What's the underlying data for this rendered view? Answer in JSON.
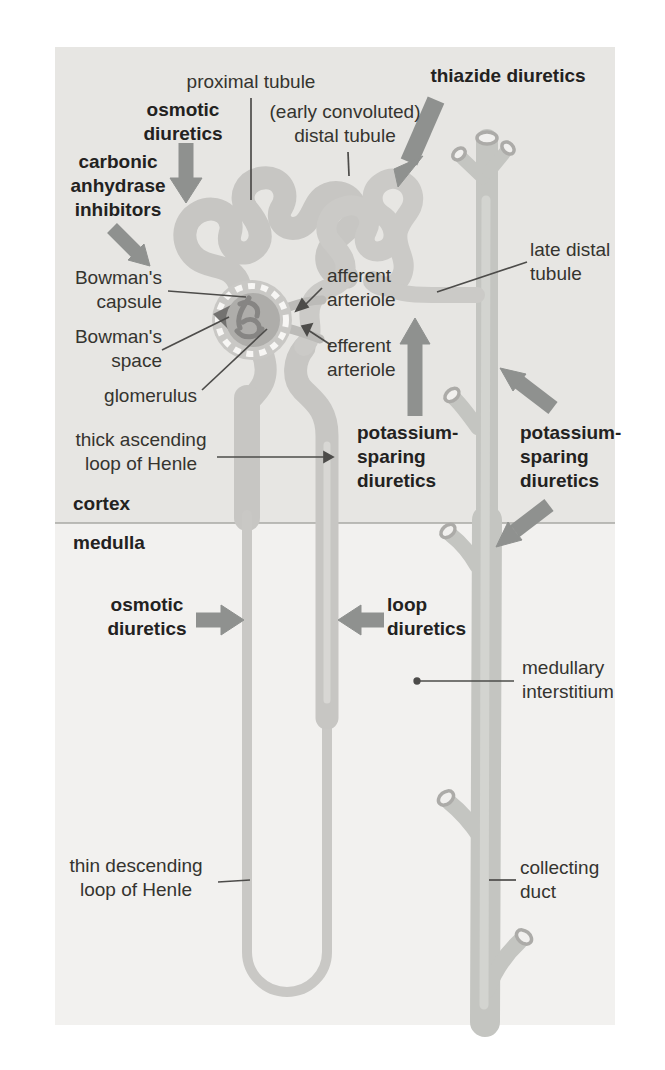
{
  "regions": {
    "cortex_label": "cortex",
    "medulla_label": "medulla"
  },
  "anatomy": {
    "proximal_tubule": "proximal tubule",
    "early_distal_tubule": "(early convoluted)\ndistal tubule",
    "late_distal_tubule": "late distal\ntubule",
    "bowmans_capsule": "Bowman's\ncapsule",
    "bowmans_space": "Bowman's\nspace",
    "glomerulus": "glomerulus",
    "afferent_arteriole": "afferent\narteriole",
    "efferent_arteriole": "efferent\narteriole",
    "thick_ascending_loop": "thick ascending\nloop of Henle",
    "thin_descending_loop": "thin descending\nloop of Henle",
    "medullary_interstitium": "medullary\ninterstitium",
    "collecting_duct": "collecting\nduct"
  },
  "drugs": {
    "osmotic_diuretics_cortex": "osmotic\ndiuretics",
    "carbonic_anhydrase_inhibitors": "carbonic\nanhydrase\ninhibitors",
    "thiazide_diuretics": "thiazide diuretics",
    "potassium_sparing_left": "potassium-\nsparing\ndiuretics",
    "potassium_sparing_right": "potassium-\nsparing\ndiuretics",
    "osmotic_diuretics_medulla": "osmotic\ndiuretics",
    "loop_diuretics": "loop\ndiuretics"
  },
  "colors": {
    "page_bg": "#ffffff",
    "cortex_bg": "#e7e6e3",
    "medulla_bg": "#f2f1ef",
    "tubule": "#c7c6c3",
    "tubule_highlight": "#d8d7d4",
    "collecting_duct": "#c4c5c1",
    "glomerulus_inner": "#aeadaa",
    "arrow": "#8f918f",
    "text": "#35342f",
    "pointer_line": "#4d4c4a"
  }
}
